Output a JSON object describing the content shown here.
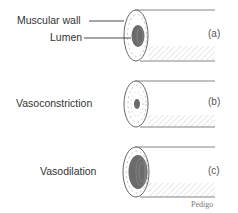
{
  "figure": {
    "labels": {
      "muscular_wall": "Muscular wall",
      "lumen": "Lumen",
      "vasoconstriction": "Vasoconstriction",
      "vasodilation": "Vasodilation"
    },
    "panels": [
      {
        "tag": "(a)",
        "state": "normal"
      },
      {
        "tag": "(b)",
        "state": "vasoconstriction"
      },
      {
        "tag": "(c)",
        "state": "vasodilation"
      }
    ],
    "credit": "Pedigo",
    "colors": {
      "line": "#555555",
      "lumen": "#6b6b6b",
      "hatch": "#bbbbbb"
    }
  }
}
